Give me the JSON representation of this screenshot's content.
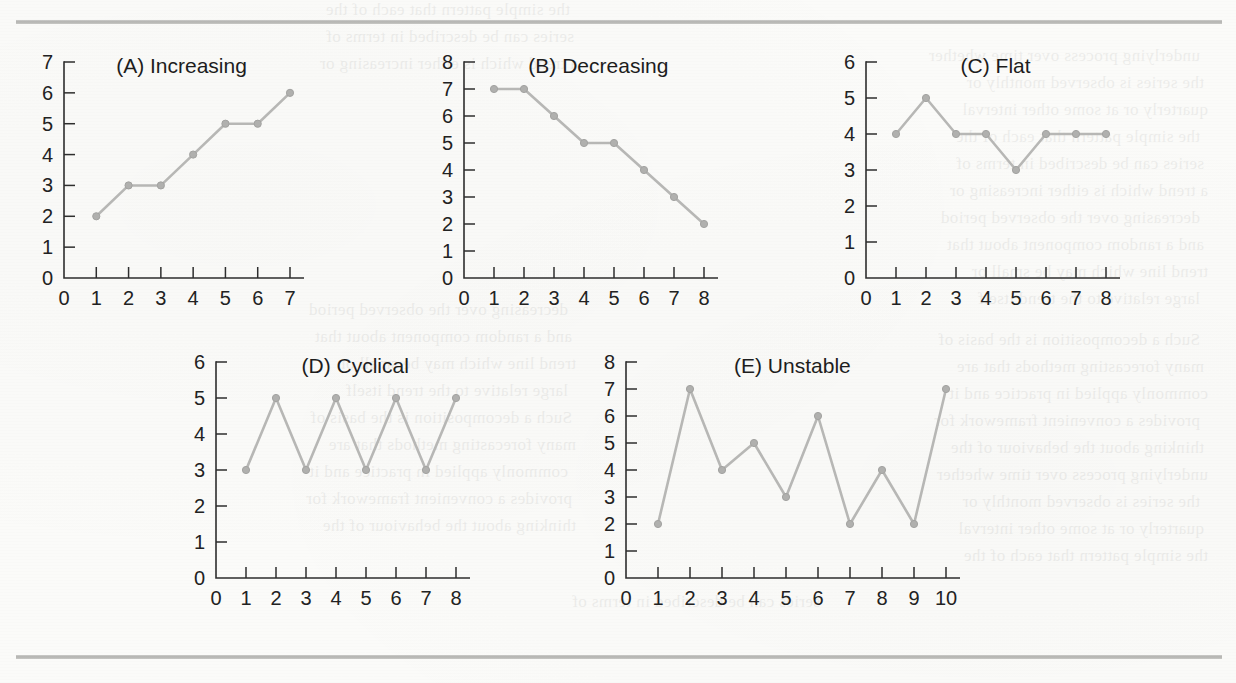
{
  "page": {
    "background_color": "#fbfbf9",
    "rule_color": "#b0b0ad",
    "ink_color": "#2e2e2e",
    "series_color": "#b7b7b5",
    "ghost_text": [
      "the simple pattern that each of the",
      "series can be described in terms of",
      "a trend which is either increasing or",
      "decreasing over the observed period",
      "and a random component about that",
      "trend line which may be small or",
      "large relative to the trend itself",
      "Such a decomposition is the basis of",
      "many forecasting methods that are",
      "commonly applied in practice and it",
      "provides a convenient framework for",
      "thinking about the behaviour of the",
      "underlying process over time whether",
      "the series is observed monthly or",
      "quarterly or at some other interval"
    ]
  },
  "chart_data": [
    {
      "id": "A",
      "type": "line",
      "title": "(A) Increasing",
      "x": [
        1,
        2,
        3,
        4,
        5,
        6,
        7
      ],
      "values": [
        2,
        3,
        3,
        4,
        5,
        5,
        6
      ],
      "xticks": [
        0,
        1,
        2,
        3,
        4,
        5,
        6,
        7
      ],
      "yticks": [
        0,
        1,
        2,
        3,
        4,
        5,
        6,
        7
      ],
      "xlim": [
        0,
        7
      ],
      "ylim": [
        0,
        7
      ],
      "xlabel": "",
      "ylabel": "",
      "grid": false,
      "legend": false
    },
    {
      "id": "B",
      "type": "line",
      "title": "(B) Decreasing",
      "x": [
        1,
        2,
        3,
        4,
        5,
        6,
        7,
        8
      ],
      "values": [
        7,
        7,
        6,
        5,
        5,
        4,
        3,
        2
      ],
      "xticks": [
        0,
        1,
        2,
        3,
        4,
        5,
        6,
        7,
        8
      ],
      "yticks": [
        0,
        1,
        2,
        3,
        4,
        5,
        6,
        7,
        8
      ],
      "xlim": [
        0,
        8
      ],
      "ylim": [
        0,
        8
      ],
      "xlabel": "",
      "ylabel": "",
      "grid": false,
      "legend": false
    },
    {
      "id": "C",
      "type": "line",
      "title": "(C) Flat",
      "x": [
        1,
        2,
        3,
        4,
        5,
        6,
        7,
        8
      ],
      "values": [
        4,
        5,
        4,
        4,
        3,
        4,
        4,
        4
      ],
      "xticks": [
        0,
        1,
        2,
        3,
        4,
        5,
        6,
        7,
        8
      ],
      "yticks": [
        0,
        1,
        2,
        3,
        4,
        5,
        6
      ],
      "xlim": [
        0,
        8
      ],
      "ylim": [
        0,
        6
      ],
      "xlabel": "",
      "ylabel": "",
      "grid": false,
      "legend": false
    },
    {
      "id": "D",
      "type": "line",
      "title": "(D) Cyclical",
      "x": [
        1,
        2,
        3,
        4,
        5,
        6,
        7,
        8
      ],
      "values": [
        3,
        5,
        3,
        5,
        3,
        5,
        3,
        5
      ],
      "xticks": [
        0,
        1,
        2,
        3,
        4,
        5,
        6,
        7,
        8
      ],
      "yticks": [
        0,
        1,
        2,
        3,
        4,
        5,
        6
      ],
      "xlim": [
        0,
        8
      ],
      "ylim": [
        0,
        6
      ],
      "xlabel": "",
      "ylabel": "",
      "grid": false,
      "legend": false
    },
    {
      "id": "E",
      "type": "line",
      "title": "(E) Unstable",
      "x": [
        1,
        2,
        3,
        4,
        5,
        6,
        7,
        8,
        9,
        10
      ],
      "values": [
        2,
        7,
        4,
        5,
        3,
        6,
        2,
        4,
        2,
        7
      ],
      "xticks": [
        0,
        1,
        2,
        3,
        4,
        5,
        6,
        7,
        8,
        9,
        10
      ],
      "yticks": [
        0,
        1,
        2,
        3,
        4,
        5,
        6,
        7,
        8
      ],
      "xlim": [
        0,
        10
      ],
      "ylim": [
        0,
        8
      ],
      "xlabel": "",
      "ylabel": "",
      "grid": false,
      "legend": false
    }
  ],
  "layout": {
    "charts": [
      {
        "id": "A",
        "left": 18,
        "top": 48,
        "plot_w": 226,
        "plot_h": 216,
        "title_x": 0.52
      },
      {
        "id": "B",
        "left": 418,
        "top": 48,
        "plot_w": 240,
        "plot_h": 216,
        "title_x": 0.56
      },
      {
        "id": "C",
        "left": 820,
        "top": 48,
        "plot_w": 240,
        "plot_h": 216,
        "title_x": 0.54
      },
      {
        "id": "D",
        "left": 170,
        "top": 348,
        "plot_w": 240,
        "plot_h": 216,
        "title_x": 0.58
      },
      {
        "id": "E",
        "left": 580,
        "top": 348,
        "plot_w": 320,
        "plot_h": 216,
        "title_x": 0.52
      }
    ]
  }
}
